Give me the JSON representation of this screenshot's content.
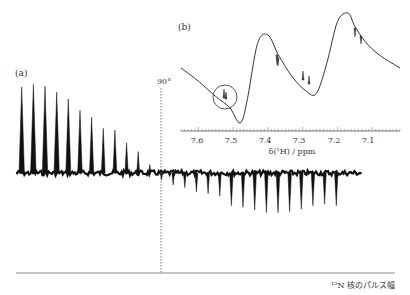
{
  "chart_data": [
    {
      "id": "a",
      "type": "bar",
      "title": "(a)",
      "description": "15N pulse-width array: peak amplitudes versus 15N pulse width; signal passes through null at 90 degrees",
      "xlabel": "15N 核のパルス幅",
      "ylabel": "",
      "marker_label": "90°",
      "marker_position_index": 11.5,
      "grid": false,
      "values": [
        100,
        103,
        101,
        94,
        86,
        73,
        65,
        52,
        50,
        35,
        25,
        10,
        -8,
        -14,
        -17,
        -22,
        -24,
        -27,
        -38,
        -40,
        -43,
        -46,
        -46,
        -45,
        -42,
        -38,
        -36,
        -38
      ]
    },
    {
      "id": "b",
      "type": "line",
      "title": "(b)",
      "description": "1H NMR spectrum with broad dispersive baseline; small circled multiplet near 7.51 ppm",
      "xlabel": "δ(¹H) / ppm",
      "ylabel": "",
      "xlim": [
        7.65,
        7.02
      ],
      "x_ticks": [
        7.6,
        7.5,
        7.4,
        7.3,
        7.2,
        7.1
      ],
      "x_tick_labels": [
        "7.6",
        "7.5",
        "7.4",
        "7.3",
        "7.2",
        "7.1"
      ],
      "grid": false,
      "annotations": [
        {
          "type": "circle",
          "x": 7.51,
          "label": "circled multiplet"
        }
      ],
      "x": [
        7.65,
        7.6,
        7.55,
        7.51,
        7.48,
        7.46,
        7.43,
        7.4,
        7.37,
        7.33,
        7.29,
        7.26,
        7.23,
        7.2,
        7.17,
        7.15,
        7.12,
        7.08,
        7.02
      ],
      "y": [
        0.5,
        0.38,
        0.24,
        0.14,
        0.0,
        0.2,
        0.72,
        0.8,
        0.62,
        0.42,
        0.29,
        0.27,
        0.55,
        0.92,
        1.0,
        0.88,
        0.74,
        0.62,
        0.5
      ]
    }
  ],
  "labels": {
    "panel_a": "(a)",
    "panel_b": "(b)",
    "marker_90": "90°",
    "x_axis_a": "¹⁵N 核のパルス幅",
    "x_axis_b": "δ(¹H) / ppm",
    "tick_76": "7.6",
    "tick_75": "7.5",
    "tick_74": "7.4",
    "tick_73": "7.3",
    "tick_72": "7.2",
    "tick_71": "7.1"
  }
}
